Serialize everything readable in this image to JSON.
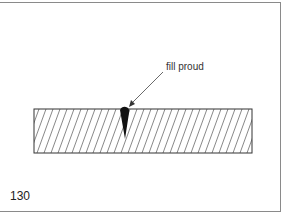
{
  "figure": {
    "annotation": "fill proud",
    "figure_number": "130",
    "elements": [
      "hatched-board-section",
      "filled-crack",
      "leader-arrow"
    ]
  }
}
